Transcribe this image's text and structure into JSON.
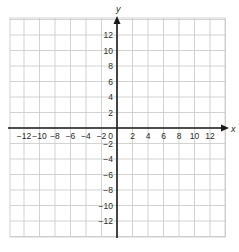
{
  "diagram": {
    "type": "coordinate-grid",
    "x_axis": {
      "label": "x",
      "min": -14,
      "max": 14,
      "tick_step": 2,
      "tick_labels": [
        "−12",
        "−10",
        "−8",
        "−6",
        "−4",
        "−2",
        "2",
        "4",
        "6",
        "8",
        "10",
        "12"
      ],
      "tick_values": [
        -12,
        -10,
        -8,
        -6,
        -4,
        -2,
        2,
        4,
        6,
        8,
        10,
        12
      ]
    },
    "y_axis": {
      "label": "y",
      "min": -14,
      "max": 14,
      "tick_step": 2,
      "tick_labels_positive": [
        "12",
        "10",
        "8",
        "6",
        "4",
        "2"
      ],
      "tick_values_positive": [
        12,
        10,
        8,
        6,
        4,
        2
      ],
      "tick_labels_negative": [
        "−2",
        "−4",
        "−6",
        "−8",
        "−10",
        "−12"
      ],
      "tick_values_negative": [
        -2,
        -4,
        -6,
        -8,
        -10,
        -12
      ]
    },
    "origin_label": "0",
    "grid": true,
    "colors": {
      "grid_line": "#c8c8c8",
      "axis_line": "#1a1a1a",
      "label_text": "#2a2a2a",
      "background": "#ffffff"
    }
  }
}
